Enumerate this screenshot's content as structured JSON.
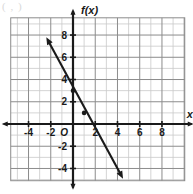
{
  "figure": {
    "name": "coordinate-plane-linear-function-graph",
    "corner_mark": "( , )",
    "axis_labels": {
      "x": "x",
      "y": "f(x)",
      "origin": "O"
    },
    "colors": {
      "grid_minor": "#c9c9c9",
      "grid_major": "#8c8c8c",
      "axis": "#1a1a1a",
      "curve": "#1a1a1a",
      "background": "#ffffff"
    }
  },
  "chart_data": {
    "type": "line",
    "title": "",
    "xlabel": "x",
    "ylabel": "f(x)",
    "xlim": [
      -5.6,
      10.1
    ],
    "ylim": [
      -5.1,
      9.6
    ],
    "xticks": [
      -4,
      -2,
      2,
      4,
      6,
      8
    ],
    "xtick_labels": [
      "-4",
      "-2",
      "2",
      "4",
      "6",
      "8"
    ],
    "yticks": [
      8,
      6,
      4,
      2,
      -2,
      -4
    ],
    "ytick_labels": [
      "8",
      "6",
      "4",
      "2",
      "-2",
      "-4"
    ],
    "origin_label": "O",
    "grid": true,
    "grid_step": 1,
    "major_grid_step": 2,
    "legend": null,
    "series": [
      {
        "name": "f(x) = -2x + 3",
        "type": "line",
        "slope": -2,
        "intercept": 3,
        "arrows": "both",
        "endpoints": [
          {
            "x": -2.4,
            "y": 7.8
          },
          {
            "x": 4.5,
            "y": -6.0
          }
        ],
        "marked_points": [
          {
            "x": 0,
            "y": 3
          },
          {
            "x": 1,
            "y": 1
          }
        ]
      }
    ]
  }
}
